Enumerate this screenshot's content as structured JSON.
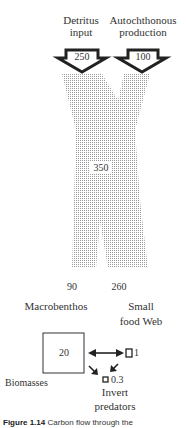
{
  "inputs": {
    "detritus": {
      "label_line1": "Detritus",
      "label_line2": "input",
      "value": "250"
    },
    "autochthonous": {
      "label_line1": "Autochthonous",
      "label_line2": "production",
      "value": "100"
    }
  },
  "total_flow": "350",
  "outputs": {
    "macrobenthos": {
      "value": "90",
      "label": "Macrobenthos"
    },
    "small_food_web": {
      "value": "260",
      "label_line1": "Small",
      "label_line2": "food Web"
    }
  },
  "biomasses": {
    "label": "Biomasses",
    "macrobenthos": "20",
    "small_food_web": "1",
    "invert_predators": {
      "value": "0.3",
      "label_line1": "Invert",
      "label_line2": "predators"
    }
  },
  "caption": {
    "figure": "Figure 1.14",
    "text": "Carbon flow through the"
  }
}
